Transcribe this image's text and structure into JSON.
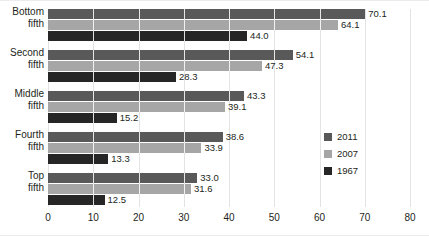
{
  "chart_data": {
    "type": "bar",
    "orientation": "horizontal",
    "title": "",
    "subtitle": "",
    "xlabel": "",
    "ylabel": "",
    "xlim": [
      0,
      80
    ],
    "xticks": [
      0,
      10,
      20,
      30,
      40,
      50,
      60,
      70,
      80
    ],
    "grid": true,
    "grid_axis": "x",
    "legend_position": "middle-right",
    "categories": [
      "Bottom fifth",
      "Second fifth",
      "Middle fifth",
      "Fourth fifth",
      "Top fifth"
    ],
    "category_lines": [
      [
        "Bottom",
        "fifth"
      ],
      [
        "Second",
        "fifth"
      ],
      [
        "Middle",
        "fifth"
      ],
      [
        "Fourth",
        "fifth"
      ],
      [
        "Top",
        "fifth"
      ]
    ],
    "series": [
      {
        "name": "2011",
        "color": "#595959",
        "values": [
          70.1,
          54.1,
          43.3,
          38.6,
          33.0
        ]
      },
      {
        "name": "2007",
        "color": "#a6a6a6",
        "values": [
          64.1,
          47.3,
          39.1,
          33.9,
          31.6
        ]
      },
      {
        "name": "1967",
        "color": "#262626",
        "values": [
          44.0,
          28.3,
          15.2,
          13.3,
          12.5
        ]
      }
    ],
    "value_labels": [
      [
        "70.1",
        "64.1",
        "44.0"
      ],
      [
        "54.1",
        "47.3",
        "28.3"
      ],
      [
        "43.3",
        "39.1",
        "15.2"
      ],
      [
        "38.6",
        "33.9",
        "13.3"
      ],
      [
        "33.0",
        "31.6",
        "12.5"
      ]
    ]
  },
  "legend": {
    "items": [
      {
        "label": "2011",
        "color": "#595959"
      },
      {
        "label": "2007",
        "color": "#a6a6a6"
      },
      {
        "label": "1967",
        "color": "#262626"
      }
    ]
  },
  "axis": {
    "x_tick_labels": [
      "0",
      "10",
      "20",
      "30",
      "40",
      "50",
      "60",
      "70",
      "80"
    ]
  },
  "colors": {
    "series_2011": "#595959",
    "series_2007": "#a6a6a6",
    "series_1967": "#262626",
    "gridline": "#e3e3e4",
    "text": "#231f20",
    "background": "#ffffff"
  }
}
